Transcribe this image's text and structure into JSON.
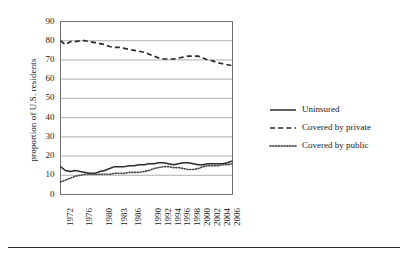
{
  "chart_data": {
    "type": "line",
    "title": "",
    "subtitle": "",
    "xlabel": "",
    "ylabel": "proportion of U.S. residents",
    "ylim": [
      0,
      90
    ],
    "yticks": [
      0,
      10,
      20,
      30,
      40,
      50,
      60,
      70,
      80,
      90
    ],
    "grid": "horizontal",
    "legend_position": "right",
    "xtick_labels": [
      "1972",
      "1976",
      "1980",
      "1983",
      "1986",
      "1990",
      "1992",
      "1994",
      "1996",
      "1998",
      "2000",
      "2002",
      "2004",
      "2006"
    ],
    "x": [
      1972,
      1973,
      1974,
      1975,
      1976,
      1977,
      1978,
      1979,
      1980,
      1981,
      1982,
      1983,
      1984,
      1985,
      1986,
      1987,
      1988,
      1989,
      1990,
      1991,
      1992,
      1993,
      1994,
      1995,
      1996,
      1997,
      1998,
      1999,
      2000,
      2001,
      2002,
      2003,
      2004,
      2005,
      2006,
      2007
    ],
    "series": [
      {
        "name": "Uninsured",
        "style": "solid",
        "color": "#2b2b2b",
        "values": [
          14.5,
          12.5,
          12.0,
          12.5,
          12.0,
          11.5,
          11.0,
          11.0,
          12.0,
          12.5,
          13.5,
          14.5,
          14.5,
          14.5,
          15.0,
          15.0,
          15.5,
          15.5,
          16.0,
          16.0,
          16.5,
          16.5,
          16.0,
          15.5,
          16.0,
          16.5,
          16.5,
          16.0,
          15.5,
          15.5,
          16.0,
          16.0,
          16.0,
          16.0,
          16.5,
          17.5
        ]
      },
      {
        "name": "Covered by private",
        "style": "dashed",
        "color": "#2b2b2b",
        "values": [
          80.0,
          78.0,
          79.5,
          79.5,
          80.0,
          80.0,
          79.5,
          79.0,
          78.5,
          78.0,
          77.0,
          76.5,
          76.5,
          76.0,
          75.5,
          75.0,
          74.5,
          74.0,
          73.0,
          72.0,
          71.0,
          70.5,
          70.5,
          70.5,
          71.0,
          71.5,
          72.0,
          72.0,
          72.0,
          71.0,
          70.0,
          69.5,
          68.5,
          68.0,
          67.5,
          67.0
        ]
      },
      {
        "name": "Covered by public",
        "style": "dotted",
        "color": "#4a4a4a",
        "values": [
          6.5,
          7.5,
          8.5,
          9.5,
          10.0,
          10.5,
          10.5,
          10.5,
          10.5,
          10.5,
          10.5,
          11.0,
          11.0,
          11.0,
          11.5,
          11.5,
          11.5,
          12.0,
          12.5,
          13.5,
          14.0,
          14.5,
          14.5,
          14.0,
          14.0,
          13.5,
          13.0,
          13.0,
          13.5,
          14.5,
          15.0,
          15.0,
          15.0,
          15.5,
          15.5,
          16.0
        ]
      }
    ]
  },
  "legend": {
    "entries": [
      {
        "label": "Uninsured",
        "style": "solid"
      },
      {
        "label": "Covered by private",
        "style": "dashed"
      },
      {
        "label": "Covered by public",
        "style": "dotted"
      }
    ]
  }
}
